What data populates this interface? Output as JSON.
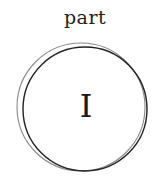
{
  "header": {
    "label": "part"
  },
  "emblem": {
    "numeral": "I",
    "ring_color_dark": "#1a1a1a",
    "ring_color_light": "#7a7a7a"
  }
}
